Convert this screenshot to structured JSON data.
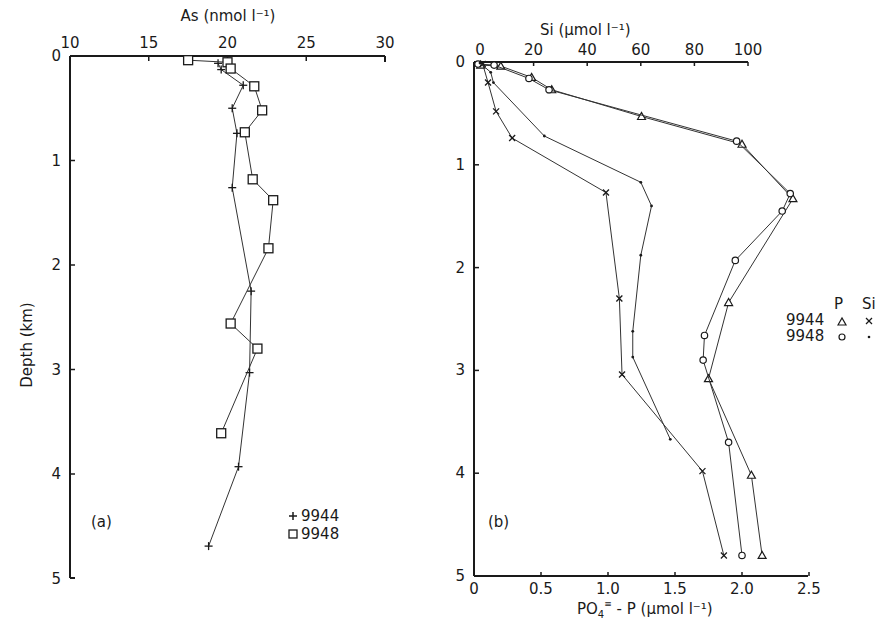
{
  "chart_data": [
    {
      "panel": "(a)",
      "type": "line",
      "title": "",
      "xlabel": "As (nmol l⁻¹)",
      "ylabel": "Depth (km)",
      "x_axis_position": "top",
      "xlim": [
        10,
        30
      ],
      "ylim": [
        5,
        0
      ],
      "x_ticks": [
        10,
        15,
        20,
        25,
        30
      ],
      "y_ticks": [
        0,
        1,
        2,
        3,
        4,
        5
      ],
      "grid": false,
      "legend": {
        "position": "lower right",
        "entries": [
          {
            "marker": "+",
            "label": "9944"
          },
          {
            "marker": "□",
            "label": "9948"
          }
        ]
      },
      "series": [
        {
          "name": "9944",
          "marker": "+",
          "points": [
            [
              19.4,
              0.07
            ],
            [
              19.6,
              0.13
            ],
            [
              21.0,
              0.28
            ],
            [
              20.3,
              0.5
            ],
            [
              20.6,
              0.74
            ],
            [
              20.3,
              1.26
            ],
            [
              21.5,
              2.25
            ],
            [
              21.4,
              3.03
            ],
            [
              20.7,
              3.93
            ],
            [
              18.8,
              4.69
            ]
          ]
        },
        {
          "name": "9948",
          "marker": "square",
          "points": [
            [
              17.5,
              0.04
            ],
            [
              20.0,
              0.06
            ],
            [
              20.2,
              0.12
            ],
            [
              21.7,
              0.29
            ],
            [
              22.2,
              0.52
            ],
            [
              21.1,
              0.73
            ],
            [
              21.6,
              1.18
            ],
            [
              22.9,
              1.38
            ],
            [
              22.6,
              1.84
            ],
            [
              20.2,
              2.56
            ],
            [
              21.9,
              2.8
            ],
            [
              19.6,
              3.61
            ]
          ]
        }
      ]
    },
    {
      "panel": "(b)",
      "type": "line",
      "title": "",
      "xlabel_top": "Si (μmol l⁻¹)",
      "xlabel_bottom": "PO₄³⁻ - P (μmol l⁻¹)",
      "ylabel": "Depth (km)",
      "xlim_top": [
        0,
        100
      ],
      "xlim_bottom": [
        0,
        2.5
      ],
      "ylim": [
        5,
        0
      ],
      "x_ticks_top": [
        0,
        20,
        40,
        60,
        80,
        100
      ],
      "x_ticks_bottom": [
        0,
        0.5,
        1.0,
        1.5,
        2.0,
        2.5
      ],
      "y_ticks": [
        0,
        1,
        2,
        3,
        4,
        5
      ],
      "grid": false,
      "legend": {
        "position": "right",
        "header": [
          "P",
          "Si"
        ],
        "rows": [
          {
            "label": "9944",
            "P": "△",
            "Si": "×"
          },
          {
            "label": "9948",
            "P": "○",
            "Si": "•"
          }
        ]
      },
      "series": [
        {
          "name": "9944 P",
          "marker": "triangle",
          "axis": "bottom",
          "points": [
            [
              0.05,
              0.03
            ],
            [
              0.2,
              0.04
            ],
            [
              0.43,
              0.15
            ],
            [
              0.58,
              0.27
            ],
            [
              1.25,
              0.53
            ],
            [
              2.0,
              0.8
            ],
            [
              2.38,
              1.33
            ],
            [
              1.9,
              2.34
            ],
            [
              1.75,
              3.08
            ],
            [
              2.07,
              4.02
            ],
            [
              2.15,
              4.8
            ]
          ]
        },
        {
          "name": "9948 P",
          "marker": "circle",
          "axis": "bottom",
          "points": [
            [
              0.03,
              0.02
            ],
            [
              0.15,
              0.03
            ],
            [
              0.41,
              0.16
            ],
            [
              0.56,
              0.27
            ],
            [
              1.96,
              0.77
            ],
            [
              2.36,
              1.28
            ],
            [
              2.3,
              1.45
            ],
            [
              1.95,
              1.93
            ],
            [
              1.72,
              2.66
            ],
            [
              1.71,
              2.9
            ],
            [
              1.9,
              3.7
            ],
            [
              2.0,
              4.8
            ]
          ]
        },
        {
          "name": "9944 Si",
          "marker": "x",
          "axis": "top",
          "points": [
            [
              1,
              0.02
            ],
            [
              3,
              0.2
            ],
            [
              6,
              0.48
            ],
            [
              12,
              0.74
            ],
            [
              47,
              1.27
            ],
            [
              52,
              2.3
            ],
            [
              53,
              3.04
            ],
            [
              83,
              3.98
            ],
            [
              91,
              4.8
            ]
          ]
        },
        {
          "name": "9948 Si",
          "marker": "dot",
          "axis": "top",
          "points": [
            [
              0,
              0.01
            ],
            [
              4,
              0.1
            ],
            [
              5,
              0.2
            ],
            [
              24,
              0.72
            ],
            [
              60,
              1.17
            ],
            [
              64,
              1.4
            ],
            [
              60,
              1.88
            ],
            [
              57,
              2.62
            ],
            [
              57,
              2.87
            ],
            [
              71,
              3.67
            ]
          ]
        }
      ]
    }
  ],
  "labels": {
    "a_title": "As (nmol l⁻¹)",
    "a_panel": "(a)",
    "a_leg1": "9944",
    "a_leg2": "9948",
    "ylabel": "Depth (km)",
    "b_top": "Si (μmol l⁻¹)",
    "b_bottom_main": "PO",
    "b_bottom_rest": " - P  (μmol l⁻¹)",
    "b_panel": "(b)",
    "leg_P": "P",
    "leg_Si": "Si",
    "leg_9944": "9944",
    "leg_9948": "9948"
  }
}
